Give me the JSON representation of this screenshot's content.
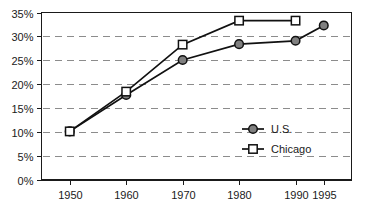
{
  "chart_data": {
    "type": "line",
    "title": "",
    "subtitle": "",
    "xlabel": "",
    "ylabel": "",
    "x": [
      1950,
      1960,
      1970,
      1980,
      1990,
      1995
    ],
    "xtick_labels": [
      "1950",
      "1960",
      "1970",
      "1980",
      "1990",
      "1995"
    ],
    "ytick_labels": [
      "0%",
      "5%",
      "10%",
      "15%",
      "20%",
      "25%",
      "30%",
      "35%"
    ],
    "ytick_values": [
      0,
      5,
      10,
      15,
      20,
      25,
      30,
      35
    ],
    "ylim": [
      0,
      35
    ],
    "xlim": [
      1945,
      2000
    ],
    "grid": "horizontal-dashed",
    "legend_position": "inside-right-middle",
    "series": [
      {
        "name": "U.S.",
        "marker": "filled-circle",
        "marker_fill": "#808080",
        "marker_stroke": "#111111",
        "line_color": "#111111",
        "x": [
          1950,
          1960,
          1970,
          1980,
          1990,
          1995
        ],
        "values": [
          10.2,
          17.8,
          25.1,
          28.4,
          29.1,
          32.3
        ]
      },
      {
        "name": "Chicago",
        "marker": "open-square",
        "marker_fill": "#ffffff",
        "marker_stroke": "#111111",
        "line_color": "#111111",
        "x": [
          1950,
          1960,
          1970,
          1980,
          1990
        ],
        "values": [
          10.2,
          18.5,
          28.3,
          33.3,
          33.3
        ]
      }
    ]
  },
  "legend": {
    "items": [
      {
        "label": "U.S."
      },
      {
        "label": "Chicago"
      }
    ]
  },
  "colors": {
    "axis": "#1a1a1a",
    "gridline": "#8c8c8c",
    "line": "#111111",
    "circle_fill": "#808080",
    "square_fill": "#ffffff",
    "background": "#ffffff"
  }
}
